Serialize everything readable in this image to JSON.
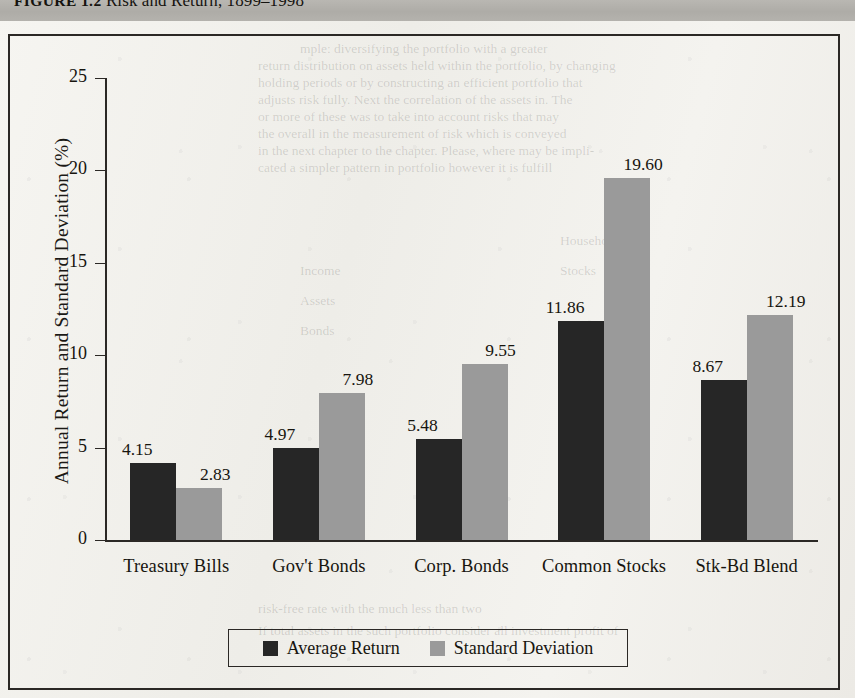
{
  "caption": {
    "figure_number": "FIGURE 1.2",
    "title": "Risk and Return, 1899–1998"
  },
  "bleed_text": {
    "line1": "mple: diversifying the portfolio with a greater",
    "line2": "return distribution on assets held within the portfolio, by changing",
    "line3": "holding periods or by constructing an efficient portfolio that",
    "line4": "adjusts risk fully. Next the correlation of the assets in. The",
    "line5": "or more of these was to take into account risks that may",
    "line6": "the overall in the measurement of risk which is conveyed",
    "line7": "in the next chapter to the chapter. Please, where may be impli-",
    "line8": "cated a simpler pattern in portfolio however it is fulfill",
    "line9": "Household",
    "line10": "Income",
    "line11": "Assets",
    "line12": "Bonds",
    "line13": "risk-free rate with the much less than two",
    "line14": "If total assets in the such portfolio consider all investment profit of",
    "line15": "Stocks"
  },
  "chart_data": {
    "type": "bar",
    "title": "Risk and Return, 1899–1998",
    "xlabel": "",
    "ylabel": "Annual Return and Standard Deviation (%)",
    "ylim": [
      0,
      25
    ],
    "yticks": [
      0,
      5,
      10,
      15,
      20,
      25
    ],
    "ytick_labels": [
      "0",
      "5",
      "10",
      "15",
      "20",
      "25"
    ],
    "grid": false,
    "legend_position": "bottom",
    "categories": [
      "Treasury Bills",
      "Gov't Bonds",
      "Corp. Bonds",
      "Common Stocks",
      "Stk-Bd Blend"
    ],
    "series": [
      {
        "name": "Average Return",
        "color": "#262626",
        "values": [
          4.15,
          4.97,
          5.48,
          11.86,
          8.67
        ],
        "value_labels": [
          "4.15",
          "4.97",
          "5.48",
          "11.86",
          "8.67"
        ]
      },
      {
        "name": "Standard Deviation",
        "color": "#9a9a9a",
        "values": [
          2.83,
          7.98,
          9.55,
          19.6,
          12.19
        ],
        "value_labels": [
          "2.83",
          "7.98",
          "9.55",
          "19.60",
          "12.19"
        ]
      }
    ]
  }
}
